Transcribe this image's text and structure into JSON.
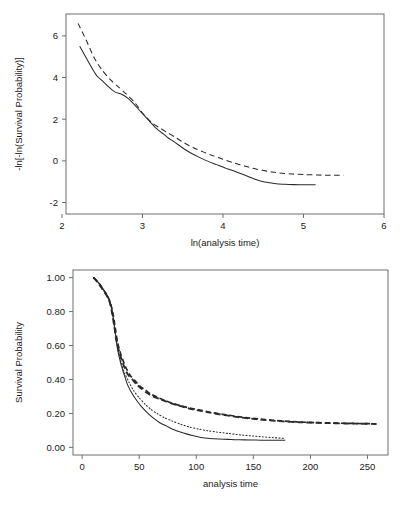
{
  "figure": {
    "background_color": "#ffffff",
    "ink_color": "#2a2a2a",
    "axis_color": "#6e6e6e"
  },
  "chart_data": [
    {
      "type": "line",
      "id": "log-log-plot",
      "title": "",
      "xlabel": "ln(analysis time)",
      "ylabel": "-ln[-ln(Survival Probability)]",
      "xlim": [
        2.05,
        6.0
      ],
      "ylim": [
        -2.55,
        7.05
      ],
      "xticks": [
        2,
        3,
        4,
        5,
        6
      ],
      "xticklabels": [
        "2",
        "3",
        "4",
        "5",
        "6"
      ],
      "yticks": [
        -2,
        0,
        2,
        4,
        6
      ],
      "yticklabels": [
        "-2",
        "0",
        "2",
        "4",
        "6"
      ],
      "grid": false,
      "legend": "none",
      "series": [
        {
          "name": "group-1-observed",
          "style": "solid",
          "x": [
            2.22,
            2.3,
            2.38,
            2.44,
            2.5,
            2.58,
            2.66,
            2.74,
            2.82,
            2.9,
            2.98,
            3.04,
            3.1,
            3.16,
            3.24,
            3.32,
            3.4,
            3.5,
            3.6,
            3.7,
            3.8,
            3.92,
            4.04,
            4.16,
            4.28,
            4.4,
            4.5,
            4.58,
            4.66,
            4.76,
            4.88,
            5.0,
            5.15
          ],
          "y": [
            5.5,
            4.95,
            4.4,
            4.05,
            3.85,
            3.55,
            3.3,
            3.2,
            3.0,
            2.7,
            2.35,
            2.1,
            1.85,
            1.6,
            1.35,
            1.1,
            0.9,
            0.62,
            0.38,
            0.18,
            0.0,
            -0.18,
            -0.36,
            -0.52,
            -0.7,
            -0.88,
            -1.0,
            -1.05,
            -1.1,
            -1.12,
            -1.14,
            -1.15,
            -1.15
          ]
        },
        {
          "name": "group-2-fitted",
          "style": "dashed",
          "x": [
            2.2,
            2.3,
            2.4,
            2.5,
            2.6,
            2.7,
            2.8,
            2.9,
            3.0,
            3.06,
            3.12,
            3.2,
            3.3,
            3.4,
            3.52,
            3.64,
            3.76,
            3.88,
            4.0,
            4.14,
            4.28,
            4.42,
            4.56,
            4.7,
            4.86,
            5.02,
            5.18,
            5.34,
            5.5
          ],
          "y": [
            6.6,
            5.8,
            4.95,
            4.35,
            3.9,
            3.55,
            3.2,
            2.82,
            2.3,
            2.05,
            1.82,
            1.62,
            1.38,
            1.15,
            0.86,
            0.62,
            0.42,
            0.24,
            0.08,
            -0.1,
            -0.26,
            -0.4,
            -0.5,
            -0.58,
            -0.63,
            -0.66,
            -0.68,
            -0.69,
            -0.69
          ]
        }
      ]
    },
    {
      "type": "line",
      "id": "kaplan-meier-plot",
      "title": "",
      "xlabel": "analysis time",
      "ylabel": "Survival Probability",
      "xlim": [
        -8,
        268
      ],
      "ylim": [
        -0.045,
        1.045
      ],
      "xticks": [
        0,
        50,
        100,
        150,
        200,
        250
      ],
      "xticklabels": [
        "0",
        "50",
        "100",
        "150",
        "200",
        "250"
      ],
      "yticks": [
        0.0,
        0.2,
        0.4,
        0.6,
        0.8,
        1.0
      ],
      "yticklabels": [
        "0.00",
        "0.20",
        "0.40",
        "0.60",
        "0.80",
        "1.00"
      ],
      "grid": false,
      "legend": "none",
      "series": [
        {
          "name": "group-a-observed",
          "style": "dashed-thick",
          "x": [
            10,
            14,
            18,
            21,
            24,
            26,
            28,
            30,
            33,
            36,
            40,
            44,
            48,
            52,
            57,
            62,
            68,
            74,
            80,
            88,
            96,
            104,
            112,
            120,
            130,
            140,
            150,
            162,
            176,
            190,
            205,
            222,
            240,
            258
          ],
          "y": [
            1.0,
            0.97,
            0.93,
            0.9,
            0.86,
            0.8,
            0.72,
            0.63,
            0.55,
            0.49,
            0.43,
            0.4,
            0.37,
            0.345,
            0.32,
            0.3,
            0.285,
            0.27,
            0.255,
            0.24,
            0.225,
            0.215,
            0.205,
            0.195,
            0.185,
            0.175,
            0.168,
            0.16,
            0.153,
            0.148,
            0.145,
            0.142,
            0.14,
            0.138
          ]
        },
        {
          "name": "group-a-fitted",
          "style": "dashed-thick-2",
          "x": [
            10,
            15,
            19,
            22,
            25,
            27,
            29,
            31,
            34,
            38,
            42,
            46,
            50,
            55,
            60,
            66,
            72,
            78,
            86,
            94,
            102,
            110,
            118,
            128,
            138,
            148,
            160,
            174,
            188,
            204,
            220,
            238,
            256
          ],
          "y": [
            1.0,
            0.965,
            0.925,
            0.895,
            0.845,
            0.79,
            0.705,
            0.62,
            0.545,
            0.475,
            0.425,
            0.395,
            0.365,
            0.34,
            0.315,
            0.295,
            0.278,
            0.262,
            0.246,
            0.232,
            0.221,
            0.21,
            0.2,
            0.19,
            0.18,
            0.172,
            0.164,
            0.156,
            0.15,
            0.146,
            0.143,
            0.141,
            0.139
          ]
        },
        {
          "name": "group-b-observed",
          "style": "solid",
          "x": [
            10,
            15,
            19,
            22,
            25,
            27,
            29,
            31,
            34,
            37,
            40,
            44,
            48,
            52,
            57,
            62,
            68,
            74,
            80,
            86,
            92,
            98,
            104,
            112,
            120,
            128,
            134,
            142,
            152,
            162,
            172,
            178
          ],
          "y": [
            1.0,
            0.965,
            0.925,
            0.895,
            0.845,
            0.775,
            0.675,
            0.58,
            0.49,
            0.425,
            0.365,
            0.315,
            0.275,
            0.24,
            0.205,
            0.175,
            0.145,
            0.125,
            0.105,
            0.09,
            0.078,
            0.068,
            0.058,
            0.052,
            0.049,
            0.047,
            0.045,
            0.044,
            0.043,
            0.042,
            0.042,
            0.042
          ]
        },
        {
          "name": "group-b-fitted",
          "style": "dotted",
          "x": [
            10,
            15,
            19,
            22,
            25,
            27,
            29,
            31,
            34,
            37,
            41,
            45,
            50,
            55,
            60,
            66,
            72,
            79,
            86,
            94,
            102,
            110,
            118,
            128,
            138,
            148,
            158,
            168,
            178
          ],
          "y": [
            1.0,
            0.965,
            0.925,
            0.895,
            0.845,
            0.775,
            0.68,
            0.59,
            0.505,
            0.44,
            0.385,
            0.335,
            0.292,
            0.255,
            0.225,
            0.198,
            0.175,
            0.155,
            0.137,
            0.12,
            0.108,
            0.098,
            0.09,
            0.082,
            0.074,
            0.068,
            0.062,
            0.057,
            0.052
          ]
        }
      ]
    }
  ]
}
